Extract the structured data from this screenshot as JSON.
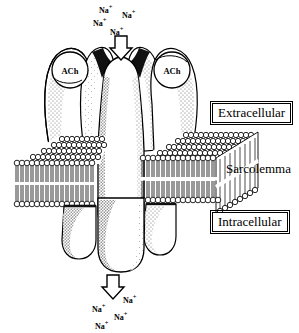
{
  "diagram": {
    "type": "biological-cross-section",
    "colors": {
      "ink": "#000000",
      "background": "#ffffff",
      "protein_fill": "#ffffff",
      "stipple": "#3a3a3a"
    }
  },
  "binding_sites": [
    {
      "id": "ach-left",
      "label": "ACh",
      "cx": 70,
      "cy": 70,
      "r": 18
    },
    {
      "id": "ach-right",
      "label": "ACh",
      "cx": 172,
      "cy": 70,
      "r": 18
    }
  ],
  "side_labels": [
    {
      "id": "extracellular",
      "text": "Extracellular",
      "boxed": true,
      "x": 212,
      "y": 103
    },
    {
      "id": "sarcolemma",
      "text": "Sarcolemma",
      "boxed": false,
      "x": 226,
      "y": 162
    },
    {
      "id": "intracellular",
      "text": "Intracellular",
      "boxed": true,
      "x": 212,
      "y": 212
    }
  ],
  "ions_top": [
    {
      "text": "Na",
      "charge": "+",
      "x": 99,
      "y": 7
    },
    {
      "text": "Na",
      "charge": "+",
      "x": 122,
      "y": 12
    },
    {
      "text": "Na",
      "charge": "+",
      "x": 93,
      "y": 20
    },
    {
      "text": "Na",
      "charge": "+",
      "x": 110,
      "y": 29
    }
  ],
  "ions_bottom": [
    {
      "text": "Na",
      "charge": "+",
      "x": 123,
      "y": 297
    },
    {
      "text": "Na",
      "charge": "+",
      "x": 92,
      "y": 306
    },
    {
      "text": "Na",
      "charge": "+",
      "x": 114,
      "y": 314
    },
    {
      "text": "Na",
      "charge": "+",
      "x": 95,
      "y": 323
    }
  ],
  "arrows": [
    {
      "id": "influx-arrow-top",
      "direction": "down",
      "x": 112,
      "y": 36,
      "w": 14,
      "h": 22
    },
    {
      "id": "influx-arrow-bottom",
      "direction": "down",
      "x": 104,
      "y": 275,
      "w": 14,
      "h": 22
    }
  ],
  "membrane": {
    "name": "sarcolemma-lipid-bilayer",
    "leaflets": 2,
    "left_panel": {
      "x": 14,
      "y": 148,
      "w": 122,
      "h": 68
    },
    "right_panel": {
      "x": 140,
      "y": 140,
      "w": 118,
      "h": 76
    }
  },
  "channel": {
    "name": "ion-channel-pore",
    "subunits_top": 5,
    "lobes_bottom": 3
  }
}
